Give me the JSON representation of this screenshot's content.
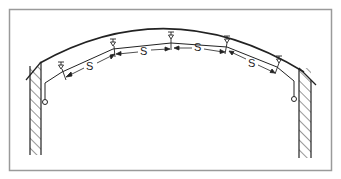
{
  "diagram": {
    "type": "pipe support spacing along curved tunnel / arch",
    "frame": {
      "border_color": "#9a9a9a"
    },
    "colors": {
      "line": "#222222",
      "hatch": "#333333"
    },
    "labels": {
      "span_1": "S",
      "span_2": "S",
      "span_3": "S",
      "span_4": "S"
    },
    "supports_count": 5,
    "walls": [
      "left-wall",
      "right-wall"
    ],
    "end_fittings": [
      "left-end-ring",
      "right-end-ring"
    ]
  }
}
